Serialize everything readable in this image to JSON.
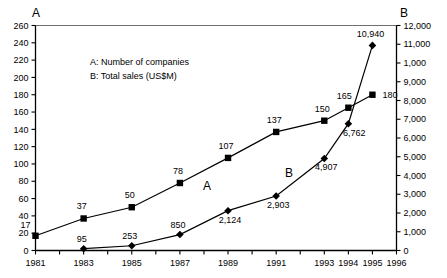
{
  "chart_data": {
    "type": "line",
    "title": "",
    "subtitle": "",
    "xlabel": "",
    "grid": false,
    "legend_position": "inside-top-left",
    "x": [
      1981,
      1982,
      1983,
      1984,
      1985,
      1986,
      1987,
      1988,
      1989,
      1990,
      1991,
      1992,
      1993,
      1994,
      1995,
      1996
    ],
    "x_tick_labels": [
      "1981",
      "",
      "1983",
      "",
      "1985",
      "",
      "1987",
      "",
      "1989",
      "",
      "1991",
      "",
      "1993",
      "1994",
      "1995",
      "1996"
    ],
    "x_labeled_years": [
      "1981",
      "1983",
      "1985",
      "1987",
      "1989",
      "1991",
      "1993",
      "1994",
      "1995",
      "1996"
    ],
    "xlim": [
      1981,
      1996
    ],
    "left_axis": {
      "name": "A",
      "label": "A",
      "ylabel": "",
      "ylim": [
        0,
        260
      ],
      "tick_step": 20,
      "tick_labels": [
        "0",
        "20",
        "40",
        "60",
        "80",
        "100",
        "120",
        "140",
        "160",
        "180",
        "200",
        "220",
        "240",
        "260"
      ]
    },
    "right_axis": {
      "name": "B",
      "label": "B",
      "ylabel": "",
      "ylim": [
        0,
        12000
      ],
      "tick_step": 1000,
      "tick_labels": [
        "0",
        "1,000",
        "2,000",
        "3,000",
        "4,000",
        "5,000",
        "6,000",
        "7,000",
        "8,000",
        "9,000",
        "1,000",
        "11,000",
        "12,000"
      ]
    },
    "series": [
      {
        "name": "A",
        "key": "companies",
        "axis": "left",
        "marker": "square",
        "color": "#000000",
        "annotation": "A",
        "points": [
          {
            "x": 1981,
            "y": 17,
            "label": "17"
          },
          {
            "x": 1983,
            "y": 37,
            "label": "37"
          },
          {
            "x": 1985,
            "y": 50,
            "label": "50"
          },
          {
            "x": 1987,
            "y": 78,
            "label": "78"
          },
          {
            "x": 1989,
            "y": 107,
            "label": "107"
          },
          {
            "x": 1991,
            "y": 137,
            "label": "137"
          },
          {
            "x": 1993,
            "y": 150,
            "label": "150"
          },
          {
            "x": 1994,
            "y": 165,
            "label": "165"
          },
          {
            "x": 1995,
            "y": 180,
            "label": "180"
          }
        ]
      },
      {
        "name": "B",
        "key": "total_sales",
        "axis": "right",
        "marker": "diamond",
        "color": "#000000",
        "annotation": "B",
        "points": [
          {
            "x": 1983,
            "y": 95,
            "label": "95"
          },
          {
            "x": 1985,
            "y": 253,
            "label": "253"
          },
          {
            "x": 1987,
            "y": 850,
            "label": "850"
          },
          {
            "x": 1989,
            "y": 2124,
            "label": "2,124"
          },
          {
            "x": 1991,
            "y": 2903,
            "label": "2,903"
          },
          {
            "x": 1993,
            "y": 4907,
            "label": "4,907"
          },
          {
            "x": 1994,
            "y": 6762,
            "label": "6,762"
          },
          {
            "x": 1995,
            "y": 10940,
            "label": "10,940"
          }
        ]
      }
    ],
    "legend": {
      "line_a": "A: Number of companies",
      "line_b": "B: Total sales (US$M)"
    },
    "colors": {
      "axis": "#000000",
      "line": "#000000",
      "marker": "#000000",
      "text": "#000000",
      "background": "#ffffff",
      "top_border": "#6f6f6f"
    }
  }
}
